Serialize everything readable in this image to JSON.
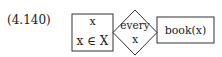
{
  "equation_label": "(4.140)",
  "diagram": {
    "left_box": {
      "line1": "x",
      "line2": "x ∈ X"
    },
    "diamond": {
      "line1": "every",
      "line2": "x"
    },
    "right_box": {
      "text": "book(x)"
    }
  }
}
